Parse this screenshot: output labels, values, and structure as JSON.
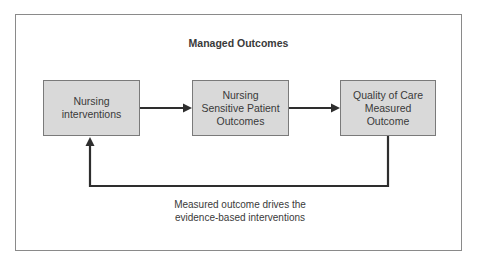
{
  "diagram": {
    "title": "Managed Outcomes",
    "nodes": [
      {
        "id": "nursing-interventions",
        "label": "Nursing\ninterventions"
      },
      {
        "id": "nursing-sensitive-patient-outcomes",
        "label": "Nursing\nSensitive Patient\nOutcomes"
      },
      {
        "id": "quality-of-care-measured-outcome",
        "label": "Quality of Care\nMeasured\nOutcome"
      }
    ],
    "edges": [
      {
        "from": "nursing-interventions",
        "to": "nursing-sensitive-patient-outcomes"
      },
      {
        "from": "nursing-sensitive-patient-outcomes",
        "to": "quality-of-care-measured-outcome"
      },
      {
        "from": "quality-of-care-measured-outcome",
        "to": "nursing-interventions",
        "label": "Measured outcome drives the\nevidence-based interventions"
      }
    ],
    "feedback_caption": "Measured outcome drives the\nevidence-based interventions",
    "colors": {
      "box_fill": "#d9d9d9",
      "box_border": "#7a7a7a",
      "arrow": "#2e2e2e",
      "frame_border": "#8a8a8a",
      "text": "#3a3a3a"
    }
  }
}
